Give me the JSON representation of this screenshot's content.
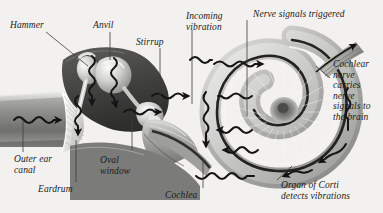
{
  "figure": {
    "type": "anatomical-diagram",
    "palette": {
      "background": "#f2f1ef",
      "ink": "#1b1b1b",
      "leader": "#3c3c3c",
      "structure_dark": "#4a4a4a",
      "structure_mid": "#8d8d8d",
      "structure_light": "#d8d8d6",
      "highlight": "#ffffff",
      "arrow": "#141414"
    }
  },
  "labels": {
    "hammer": "Hammer",
    "anvil": "Anvil",
    "stirrup": "Stirrup",
    "incoming_vibration": "Incoming\nvibration",
    "nerve_signals_triggered": "Nerve signals triggered",
    "cochlear_nerve": "Cochlear\nnerve\ncarries\nnerve\nsignals to\nthe brain",
    "outer_ear_canal": "Outer ear\ncanal",
    "eardrum": "Eardrum",
    "oval_window": "Oval\nwindow",
    "cochlea": "Cochlea",
    "organ_of_corti": "Organ of Corti\ndetects vibrations"
  }
}
